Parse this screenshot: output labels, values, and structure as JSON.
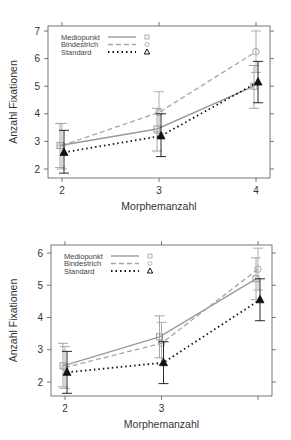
{
  "chart_data": [
    {
      "type": "line",
      "title": "",
      "xlabel": "Morphemanzahl",
      "ylabel": "Anzahl Fixationen",
      "x": [
        2,
        3,
        4
      ],
      "x_tick_labels": [
        "2",
        "3",
        "4"
      ],
      "y_ticks": [
        2,
        3,
        4,
        5,
        6,
        7
      ],
      "ylim": [
        1.9,
        7.1
      ],
      "xlim": [
        1.85,
        4.15
      ],
      "grid": false,
      "legend_position": "top-left",
      "series": [
        {
          "name": "Mediopunkt",
          "values": [
            2.85,
            3.45,
            5.0
          ],
          "err_low": [
            2.05,
            2.65,
            4.2
          ],
          "err_high": [
            3.65,
            4.2,
            5.75
          ],
          "line": "solid",
          "marker": "square",
          "color": "#9a9a9a"
        },
        {
          "name": "Bindestrich",
          "values": [
            2.85,
            4.05,
            6.25
          ],
          "err_low": [
            2.0,
            3.3,
            5.5
          ],
          "err_high": [
            3.65,
            4.8,
            7.0
          ],
          "line": "dashed",
          "marker": "circle",
          "color": "#a5a5a5"
        },
        {
          "name": "Standard",
          "values": [
            2.6,
            3.2,
            5.15
          ],
          "err_low": [
            1.85,
            2.45,
            4.4
          ],
          "err_high": [
            3.4,
            4.0,
            5.9
          ],
          "line": "dotted",
          "marker": "triangle",
          "color": "#111111"
        }
      ]
    },
    {
      "type": "line",
      "title": "",
      "xlabel": "Morphemanzahl",
      "ylabel": "Anzahl Fixationen",
      "x": [
        2,
        3,
        4
      ],
      "x_tick_labels": [
        "2",
        "3",
        ""
      ],
      "y_ticks": [
        2,
        3,
        4,
        5,
        6
      ],
      "ylim": [
        1.55,
        6.25
      ],
      "xlim": [
        1.85,
        4.15
      ],
      "grid": false,
      "legend_position": "top-left",
      "series": [
        {
          "name": "Mediopunkt",
          "values": [
            2.5,
            3.4,
            5.2
          ],
          "err_low": [
            1.85,
            2.75,
            4.55
          ],
          "err_high": [
            3.2,
            4.05,
            5.85
          ],
          "line": "solid",
          "marker": "square",
          "color": "#9a9a9a"
        },
        {
          "name": "Bindestrich",
          "values": [
            2.45,
            3.2,
            5.5
          ],
          "err_low": [
            1.8,
            2.55,
            4.85
          ],
          "err_high": [
            3.1,
            3.85,
            6.15
          ],
          "line": "dashed",
          "marker": "circle",
          "color": "#a5a5a5"
        },
        {
          "name": "Standard",
          "values": [
            2.3,
            2.6,
            4.55
          ],
          "err_low": [
            1.65,
            1.95,
            3.9
          ],
          "err_high": [
            2.95,
            3.25,
            5.2
          ],
          "line": "dotted",
          "marker": "triangle",
          "color": "#111111"
        }
      ]
    }
  ]
}
